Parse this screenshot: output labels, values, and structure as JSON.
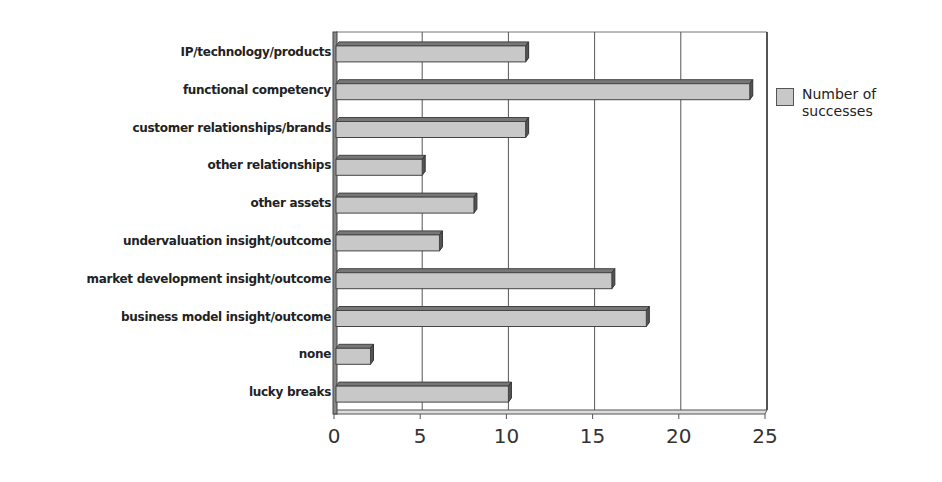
{
  "chart_data": {
    "type": "bar",
    "orientation": "horizontal",
    "title": "",
    "xlabel": "",
    "ylabel": "",
    "categories": [
      "IP/technology/products",
      "functional competency",
      "customer relationships/brands",
      "other relationships",
      "other assets",
      "undervaluation insight/outcome",
      "market development insight/outcome",
      "business model insight/outcome",
      "none",
      "lucky breaks"
    ],
    "series": [
      {
        "name": "Number of successes",
        "values": [
          11,
          24,
          11,
          5,
          8,
          6,
          16,
          18,
          2,
          10
        ]
      }
    ],
    "xlim": [
      0,
      25
    ],
    "x_ticks": [
      "0",
      "5",
      "10",
      "15",
      "20",
      "25"
    ],
    "grid": "vertical",
    "legend_position": "right",
    "colors": {
      "bar_fill": "#c8c8c8",
      "bar_edge": "#444444",
      "bar_shadow": "#555555",
      "grid": "#555555"
    }
  },
  "legend": {
    "label": "Number of successes"
  }
}
